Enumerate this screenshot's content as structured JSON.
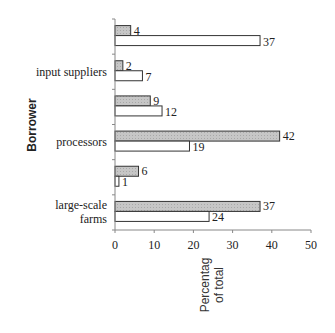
{
  "chart_data": {
    "type": "bar",
    "orientation": "horizontal",
    "title": "",
    "ylabel": "Borrower",
    "xlabel": "Percentag of total",
    "xlabel_lines": [
      "Percentag",
      "of total"
    ],
    "xlim": [
      0,
      50
    ],
    "xticks": [
      0,
      10,
      20,
      30,
      40,
      50
    ],
    "grid": false,
    "legend": null,
    "categories": [
      "",
      "input suppliers",
      "",
      "processors",
      "",
      "large-scale farms"
    ],
    "category_label_lines": [
      [],
      [
        "input suppliers"
      ],
      [],
      [
        "processors"
      ],
      [],
      [
        "large-scale",
        "farms"
      ]
    ],
    "series": [
      {
        "name": "shaded",
        "fill": "#c8c8c8",
        "values": [
          4,
          2,
          9,
          42,
          6,
          37
        ]
      },
      {
        "name": "white",
        "fill": "#ffffff",
        "values": [
          37,
          7,
          12,
          19,
          1,
          24
        ]
      }
    ]
  }
}
